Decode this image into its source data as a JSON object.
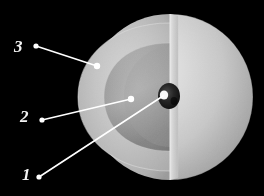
{
  "figure": {
    "background_color": "#000000",
    "width": 264,
    "height": 196,
    "line_color": "#ffffff",
    "label_color": "#f2f2f2"
  },
  "sphere": {
    "center_x": 170,
    "center_y": 97,
    "radius": 83,
    "cut_plane_x": 170,
    "outer_surface_color": "#d9d9d9",
    "shadow_color": "#8a8a8a"
  },
  "layers": [
    {
      "index": 3,
      "name": "outer-shell",
      "label": "3",
      "color": "#bdbdbd",
      "radius": 83
    },
    {
      "index": 2,
      "name": "mantle",
      "label": "2",
      "color": "#a9a9a9",
      "radius": 58
    },
    {
      "index": 1,
      "name": "core",
      "label": "1",
      "color": "#151515",
      "radius": 11,
      "highlight_color": "#ffffff"
    }
  ],
  "callouts": [
    {
      "id": "callout-3",
      "label": "3",
      "label_x": 14,
      "label_y": 38,
      "start_x": 36,
      "start_y": 46,
      "end_x": 97,
      "end_y": 66,
      "target_layer": "outer-shell"
    },
    {
      "id": "callout-2",
      "label": "2",
      "label_x": 20,
      "label_y": 108,
      "start_x": 42,
      "start_y": 120,
      "end_x": 131,
      "end_y": 99,
      "target_layer": "mantle"
    },
    {
      "id": "callout-1",
      "label": "1",
      "label_x": 22,
      "label_y": 166,
      "start_x": 39,
      "start_y": 177,
      "end_x": 163,
      "end_y": 97,
      "target_layer": "core"
    }
  ]
}
